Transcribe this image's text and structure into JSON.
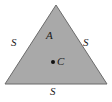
{
  "figure": {
    "type": "geometry-diagram",
    "background_color": "#ffffff",
    "triangle": {
      "fill_color": "#a9a9a9",
      "stroke_color": "#6b6b6b",
      "stroke_width": 1,
      "vertices": [
        {
          "name": "apex",
          "x": 56,
          "y": 5
        },
        {
          "name": "bottom-left",
          "x": 5,
          "y": 84
        },
        {
          "name": "bottom-right",
          "x": 107,
          "y": 84
        }
      ]
    },
    "labels": {
      "area": "A",
      "side_left": "S",
      "side_right": "S",
      "side_bottom": "S",
      "centroid": "C"
    },
    "centroid_point": {
      "x": 53,
      "y": 62,
      "color": "#111111"
    }
  }
}
